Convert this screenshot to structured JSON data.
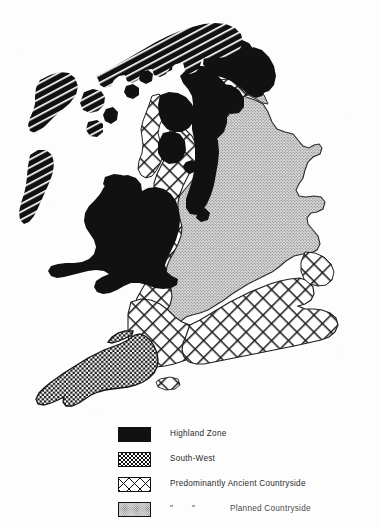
{
  "figure": {
    "kind": "thematic-map",
    "region": "Great Britain",
    "title": "",
    "background_color": "#fdfdfd",
    "ink_color": "#111111"
  },
  "legend": {
    "name": "map-legend",
    "items": [
      {
        "id": "highland-zone",
        "label": "Highland  Zone",
        "pattern": "solid-black",
        "swatch_class": "sw-highland",
        "color": "#111111"
      },
      {
        "id": "south-west",
        "label": "South-West",
        "pattern": "dense-checkerboard",
        "swatch_class": "sw-southwest",
        "color": "#111111"
      },
      {
        "id": "predominantly-ancient-countryside",
        "label": "Predominantly Ancient Countryside",
        "pattern": "diagonal-cross-hatch",
        "swatch_class": "sw-ancient",
        "color": "#111111"
      },
      {
        "id": "planned-countryside",
        "label": "Planned Countryside",
        "pattern": "fine-grey-stipple",
        "swatch_class": "sw-planned",
        "color": "#d9d9d9",
        "ditto_marks": [
          "\"",
          "\""
        ]
      }
    ]
  },
  "map": {
    "zones": [
      {
        "id": "highland-zone",
        "fill": "solid-black",
        "areas": [
          "Scottish Highlands",
          "Hebrides",
          "Southern Uplands",
          "Lake District",
          "Pennines",
          "Wales",
          "Northumberland"
        ]
      },
      {
        "id": "highland-zone-hatched",
        "fill": "diagonal-line-hatch",
        "areas": [
          "Northern Scotland (Caithness / Sutherland)",
          "Outer Hebrides",
          "Skye"
        ]
      },
      {
        "id": "south-west",
        "fill": "dense-checkerboard",
        "areas": [
          "Cornwall",
          "Devon"
        ]
      },
      {
        "id": "predominantly-ancient-countryside",
        "fill": "diagonal-cross-hatch",
        "areas": [
          "Welsh Marches",
          "Cheshire",
          "Lancashire",
          "Somerset",
          "Dorset",
          "Wessex",
          "Kent",
          "Sussex",
          "Essex",
          "Suffolk",
          "Norfolk fringe",
          "Cumbrian coast"
        ]
      },
      {
        "id": "planned-countryside",
        "fill": "fine-grey-stipple",
        "areas": [
          "Yorkshire",
          "Lincolnshire",
          "East Midlands",
          "Northumberland coast",
          "Durham",
          "Salisbury Plain"
        ]
      }
    ]
  }
}
